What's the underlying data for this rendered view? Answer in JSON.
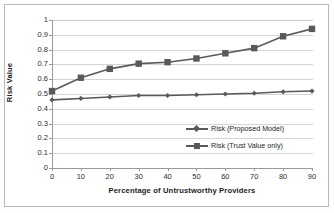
{
  "chart_data": {
    "type": "line",
    "title": "",
    "xlabel": "Percentage of Untrustworthy Providers",
    "ylabel": "Risk Value",
    "x": [
      0,
      10,
      20,
      30,
      40,
      50,
      60,
      70,
      80,
      90
    ],
    "xticklabels": [
      "0",
      "10",
      "20",
      "30",
      "40",
      "50",
      "60",
      "70",
      "80",
      "90"
    ],
    "yticklabels": [
      "0",
      "0.1",
      "0.2",
      "0.3",
      "0.4",
      "0.5",
      "0.6",
      "0.7",
      "0.8",
      "0.9",
      "1"
    ],
    "yticks": [
      0,
      0.1,
      0.2,
      0.3,
      0.4,
      0.5,
      0.6,
      0.7,
      0.8,
      0.9,
      1
    ],
    "xlim": [
      0,
      90
    ],
    "ylim": [
      0,
      1
    ],
    "grid": "horizontal",
    "legend_position": "center-right-inside",
    "series": [
      {
        "name": "Risk (Proposed Model)",
        "marker": "diamond",
        "color": "#595959",
        "values": [
          0.46,
          0.47,
          0.48,
          0.49,
          0.49,
          0.495,
          0.5,
          0.505,
          0.515,
          0.52
        ]
      },
      {
        "name": "Risk (Trust Value only)",
        "marker": "square",
        "color": "#595959",
        "values": [
          0.52,
          0.61,
          0.67,
          0.705,
          0.715,
          0.74,
          0.775,
          0.81,
          0.89,
          0.94
        ]
      }
    ]
  },
  "legend": {
    "items": [
      {
        "label": "Risk (Proposed Model)",
        "marker": "diamond-marker-icon"
      },
      {
        "label": "Risk (Trust Value only)",
        "marker": "square-marker-icon"
      }
    ]
  },
  "axes": {
    "x_title": "Percentage of Untrustworthy Providers",
    "y_title": "Risk Value"
  }
}
